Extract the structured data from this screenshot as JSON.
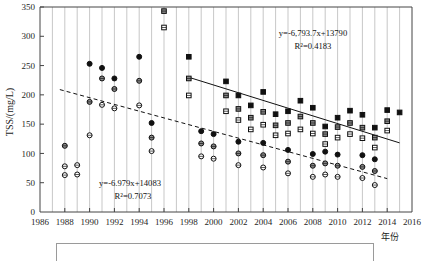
{
  "chart_data": {
    "type": "scatter",
    "title": "",
    "xlabel": "年份",
    "ylabel": "TSS/(mg/L)",
    "xlim": [
      1986,
      2016
    ],
    "ylim": [
      0,
      350
    ],
    "xticks": [
      1986,
      1988,
      1990,
      1992,
      1994,
      1996,
      1998,
      2000,
      2002,
      2004,
      2006,
      2008,
      2010,
      2012,
      2014,
      2016
    ],
    "yticks": [
      0,
      50,
      100,
      150,
      200,
      250,
      300,
      350
    ],
    "grid": "vertical-yearly",
    "legend_position": "below-axes",
    "annotations": [
      {
        "id": "upper-fit",
        "equation": "y=-6,793.7x+13790",
        "r2": "R²=0.4183"
      },
      {
        "id": "lower-fit",
        "equation": "y=-6.979x+14083",
        "r2": "R²=0.7073"
      }
    ],
    "trendlines": [
      {
        "id": "upper-fit",
        "style": "solid",
        "x0": 1998.0,
        "y0": 230,
        "x1": 2015.0,
        "y1": 118
      },
      {
        "id": "lower-fit",
        "style": "dashed",
        "x0": 1987.6,
        "y0": 209,
        "x1": 2014.0,
        "y1": 57
      }
    ],
    "series": [
      {
        "name": "filled-square",
        "marker": "square-filled",
        "points": [
          [
            1998,
            265
          ],
          [
            2001,
            223
          ],
          [
            2002,
            199
          ],
          [
            2003,
            182
          ],
          [
            2004,
            205
          ],
          [
            2005,
            167
          ],
          [
            2006,
            172
          ],
          [
            2007,
            190
          ],
          [
            2008,
            178
          ],
          [
            2009,
            146
          ],
          [
            2010,
            161
          ],
          [
            2011,
            173
          ],
          [
            2012,
            166
          ],
          [
            2013,
            144
          ],
          [
            2014,
            174
          ],
          [
            2015,
            170
          ]
        ]
      },
      {
        "name": "gray-square",
        "marker": "square-gray",
        "points": [
          [
            1996,
            343
          ],
          [
            1998,
            228
          ],
          [
            2001,
            199
          ],
          [
            2002,
            176
          ],
          [
            2003,
            161
          ],
          [
            2004,
            171
          ],
          [
            2005,
            148
          ],
          [
            2006,
            152
          ],
          [
            2007,
            163
          ],
          [
            2008,
            152
          ],
          [
            2009,
            133
          ],
          [
            2010,
            145
          ],
          [
            2011,
            152
          ],
          [
            2012,
            144
          ],
          [
            2013,
            127
          ],
          [
            2014,
            155
          ]
        ]
      },
      {
        "name": "open-square",
        "marker": "square-open",
        "points": [
          [
            1996,
            315
          ],
          [
            1998,
            199
          ],
          [
            2001,
            172
          ],
          [
            2002,
            157
          ],
          [
            2003,
            141
          ],
          [
            2004,
            149
          ],
          [
            2005,
            131
          ],
          [
            2006,
            134
          ],
          [
            2007,
            141
          ],
          [
            2008,
            134
          ],
          [
            2009,
            116
          ],
          [
            2010,
            127
          ],
          [
            2011,
            133
          ],
          [
            2012,
            126
          ],
          [
            2013,
            110
          ],
          [
            2014,
            139
          ]
        ]
      },
      {
        "name": "filled-circle",
        "marker": "circle-filled",
        "points": [
          [
            1990,
            253
          ],
          [
            1991,
            246
          ],
          [
            1992,
            228
          ],
          [
            1994,
            265
          ],
          [
            1995,
            152
          ],
          [
            1999,
            138
          ],
          [
            2000,
            133
          ],
          [
            2002,
            120
          ],
          [
            2004,
            118
          ],
          [
            2006,
            106
          ],
          [
            2008,
            99
          ],
          [
            2009,
            103
          ],
          [
            2010,
            98
          ],
          [
            2012,
            97
          ],
          [
            2013,
            90
          ]
        ]
      },
      {
        "name": "gray-circle",
        "marker": "circle-gray",
        "points": [
          [
            1988,
            113
          ],
          [
            1990,
            188
          ],
          [
            1991,
            228
          ],
          [
            1992,
            210
          ],
          [
            1994,
            224
          ],
          [
            1995,
            127
          ],
          [
            1999,
            117
          ],
          [
            2000,
            112
          ],
          [
            2002,
            100
          ],
          [
            2004,
            97
          ],
          [
            2006,
            86
          ],
          [
            2008,
            79
          ],
          [
            2009,
            83
          ],
          [
            2010,
            79
          ],
          [
            2012,
            77
          ],
          [
            2013,
            70
          ]
        ]
      },
      {
        "name": "open-circle",
        "marker": "circle-open",
        "points": [
          [
            1988,
            78
          ],
          [
            1989,
            80
          ],
          [
            1990,
            131
          ],
          [
            1991,
            183
          ],
          [
            1992,
            177
          ],
          [
            1994,
            182
          ],
          [
            1995,
            104
          ],
          [
            1999,
            95
          ],
          [
            2000,
            91
          ],
          [
            2002,
            80
          ],
          [
            2004,
            76
          ],
          [
            2006,
            66
          ],
          [
            2008,
            60
          ],
          [
            2009,
            64
          ],
          [
            2010,
            60
          ],
          [
            2012,
            58
          ],
          [
            2013,
            46
          ],
          [
            1988,
            63
          ],
          [
            1989,
            64
          ]
        ]
      }
    ]
  }
}
